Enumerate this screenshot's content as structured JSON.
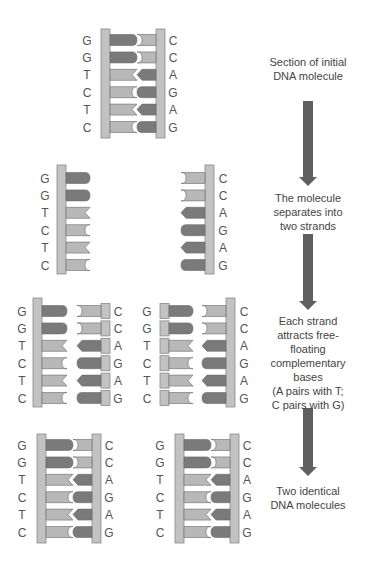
{
  "colors": {
    "backbone": "#c2c2c2",
    "backbone_stroke": "#8a8a8a",
    "dark_base": "#7a7a7a",
    "light_base": "#b8b8b8",
    "base_stroke": "#6a6a6a",
    "arrow": "#5f5f5f",
    "text": "#555555"
  },
  "sequence": {
    "left_strand": [
      "G",
      "G",
      "T",
      "C",
      "T",
      "C"
    ],
    "right_strand": [
      "C",
      "C",
      "A",
      "G",
      "A",
      "G"
    ]
  },
  "steps": [
    {
      "id": "initial",
      "caption": "Section of initial DNA molecule"
    },
    {
      "id": "separate",
      "caption": "The molecule separates into two strands"
    },
    {
      "id": "attract",
      "caption": "Each strand attracts free-floating complementary bases (A pairs with T; C pairs with G)"
    },
    {
      "id": "result",
      "caption": "Two identical DNA molecules"
    }
  ],
  "captions": {
    "initial_line1": "Section of initial",
    "initial_line2": "DNA molecule",
    "separate_line1": "The molecule",
    "separate_line2": "separates into",
    "separate_line3": "two strands",
    "attract_line1": "Each strand",
    "attract_line2": "attracts free-",
    "attract_line3": "floating",
    "attract_line4": "complementary",
    "attract_line5": "bases",
    "attract_line6": "(A pairs with T;",
    "attract_line7": "C pairs with G)",
    "result_line1": "Two identical",
    "result_line2": "DNA molecules"
  },
  "arrows": [
    {
      "from": "initial",
      "to": "separate",
      "y1": 101,
      "y2": 186
    },
    {
      "from": "separate",
      "to": "attract",
      "y1": 234,
      "y2": 310
    },
    {
      "from": "attract",
      "to": "result",
      "y1": 408,
      "y2": 476
    }
  ]
}
